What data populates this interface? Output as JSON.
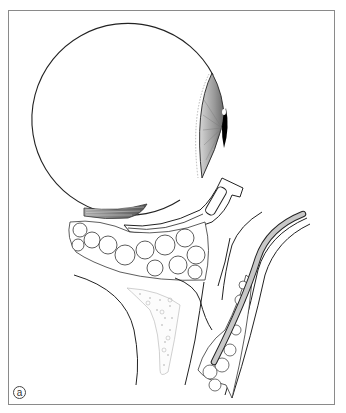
{
  "figure": {
    "panel_label": "a",
    "type": "anatomical illustration",
    "structures": [
      {
        "name": "eyeball",
        "shape": "sphere"
      },
      {
        "name": "cornea-iris",
        "shading": "gray gradient with dark pupil"
      },
      {
        "name": "inferior-rectus-muscle",
        "shading": "striated gray"
      },
      {
        "name": "orbital-fat",
        "pattern": "lobulated"
      },
      {
        "name": "orbital-floor-bone",
        "pattern": "stippled"
      },
      {
        "name": "retractor-instrument"
      },
      {
        "name": "tube-cannula",
        "fill": "light gray"
      }
    ],
    "colors": {
      "frame_border": "#8a8a8a",
      "outline": "#222222",
      "iris_light": "#d0d0d0",
      "iris_dark": "#7a7a7a",
      "pupil": "#000000",
      "tube_fill": "#c8c8c8",
      "muscle": "#888888",
      "bone_dots": "#999999"
    }
  }
}
